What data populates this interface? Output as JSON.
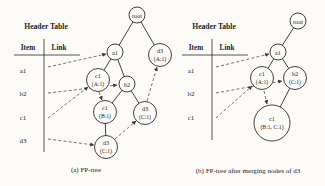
{
  "colors": {
    "ink": "#1c1c1c",
    "background": "#fcfbf7"
  },
  "panels": {
    "left": {
      "header_table": {
        "title": "Header Table",
        "columns": [
          "Item",
          "Link"
        ],
        "items": [
          "a1",
          "b2",
          "c1",
          "d3"
        ]
      },
      "tree": {
        "nodes": [
          {
            "id": "root",
            "label": "root"
          },
          {
            "id": "a1",
            "label": "a1"
          },
          {
            "id": "d3-A1",
            "label": "d3",
            "count": "(A:1)"
          },
          {
            "id": "c1-A1",
            "label": "c1",
            "count": "(A:1)"
          },
          {
            "id": "b2",
            "label": "b2"
          },
          {
            "id": "c1-B1",
            "label": "c1",
            "count": "(B:1)"
          },
          {
            "id": "d3-C1-right",
            "label": "d3",
            "count": "(C:1)"
          },
          {
            "id": "d3-C1-bottom",
            "label": "d3",
            "count": "(C:1)"
          }
        ]
      },
      "caption": "(a) FP-tree"
    },
    "right": {
      "header_table": {
        "title": "Header Table",
        "columns": [
          "Item",
          "Link"
        ],
        "items": [
          "a1",
          "b2",
          "c1"
        ]
      },
      "tree": {
        "nodes": [
          {
            "id": "root",
            "label": "root"
          },
          {
            "id": "a1",
            "label": "a1"
          },
          {
            "id": "c1-A1",
            "label": "c1",
            "count": "(A:1)"
          },
          {
            "id": "b2-C1",
            "label": "b2",
            "count": "(C:1)"
          },
          {
            "id": "c1-B1C1",
            "label": "c1",
            "count": "(B:1, C:1)"
          }
        ]
      },
      "caption": "(b) FP-tree after merging nodes of d3"
    }
  }
}
